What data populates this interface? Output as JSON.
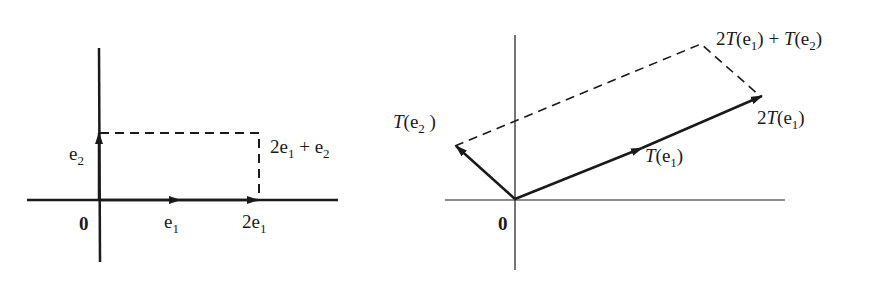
{
  "left_figure": {
    "origin_label": "0",
    "e1_label": "e",
    "e1_sub": "1",
    "e2_label": "e",
    "e2_sub": "2",
    "two_e1_prefix": "2e",
    "two_e1_sub": "1",
    "sum_prefix": "2e",
    "sum_sub1": "1",
    "sum_plus": " + e",
    "sum_sub2": "2"
  },
  "right_figure": {
    "origin_label": "0",
    "te2_T": "T",
    "te2_open": "(e",
    "te2_sub": "2",
    "te2_close": " )",
    "te1_T": "T",
    "te1_open": "(e",
    "te1_sub": "1",
    "te1_close": ")",
    "two_te1_2": "2",
    "two_te1_T": "T",
    "two_te1_open": "(e",
    "two_te1_sub": "1",
    "two_te1_close": ")",
    "sum_2": "2",
    "sum_T1": "T",
    "sum_open1": "(e",
    "sum_sub1": "1",
    "sum_close1": ") + ",
    "sum_T2": "T",
    "sum_open2": "(e",
    "sum_sub2": "2",
    "sum_close2": ")"
  },
  "colors": {
    "ink": "#1a1a1a",
    "background": "#ffffff"
  }
}
